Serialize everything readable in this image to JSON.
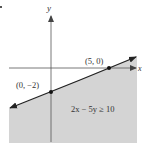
{
  "diagram": {
    "type": "linear-inequality-graph",
    "axes": {
      "x_label": "x",
      "y_label": "y"
    },
    "boundary_line": {
      "equation": "2x - 5y = 10",
      "style": "solid",
      "arrows": "both"
    },
    "points": [
      {
        "label": "(5, 0)",
        "x": 5,
        "y": 0
      },
      {
        "label": "(0, −2)",
        "x": 0,
        "y": -2
      }
    ],
    "inequality_label": "2x − 5y ≥ 10",
    "shaded_region": "below line",
    "colors": {
      "shade": "#d4d4d4",
      "line": "#222222",
      "axis": "#555555"
    }
  }
}
